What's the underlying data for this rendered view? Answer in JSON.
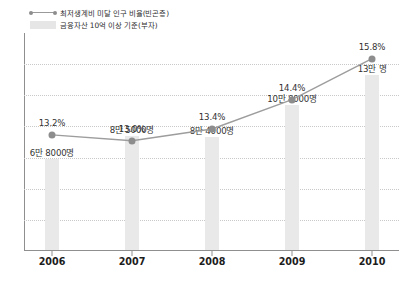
{
  "legend": {
    "items": [
      {
        "label": "최저생계비 미달 인구 비율(빈곤층)",
        "key": "line-marker-key",
        "color": "#8d8d8d"
      },
      {
        "label": "금융자산 10억 이상 기준(부자)",
        "key": "bar-swatch-key",
        "color": "#e9e9e9"
      }
    ]
  },
  "chart_data": {
    "type": "line",
    "title": "",
    "subtitle": "",
    "xlabel": "",
    "ylabel": "",
    "grid": true,
    "legend_position": "top-left",
    "categories": [
      "2006",
      "2007",
      "2008",
      "2009",
      "2010"
    ],
    "series": [
      {
        "name": "최저생계비 미달 인구 비율(빈곤층)",
        "type": "line",
        "unit": "%",
        "color": "#8d8d8d",
        "values": [
          13.2,
          13.0,
          13.4,
          14.4,
          15.8
        ],
        "labels": [
          "13.2%",
          "13.0%",
          "13.4%",
          "14.4%",
          "15.8%"
        ],
        "ylim": [
          12.0,
          16.2
        ]
      },
      {
        "name": "금융자산 10억 이상 기준(부자)",
        "type": "bar",
        "unit": "명",
        "color": "#e9e9e9",
        "values": [
          68000,
          85000,
          84000,
          108000,
          130000
        ],
        "labels": [
          "6만 8000명",
          "8만 5000명",
          "8만 4000명",
          "10만 8000명",
          "13만 명"
        ],
        "ylim": [
          0,
          140000
        ]
      }
    ]
  }
}
